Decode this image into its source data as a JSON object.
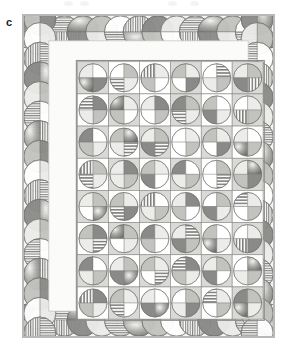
{
  "figure": {
    "panel_label": "c",
    "type": "quilt-diagram"
  },
  "colors": {
    "page_background": "#ffffff",
    "frame_background": "#f4f4f2",
    "frame_border": "#b9b9b6",
    "sashing_border": "#8d8d8a",
    "cell_light": "#ffffff",
    "cell_mid": "#d9d9d6",
    "cell_dark": "#b2b2af",
    "fill_solid_dark": "#8a8a88",
    "fill_solid_mid": "#c2c2bf",
    "fill_solid_light": "#ececea",
    "fill_white": "#ffffff",
    "stripe_ink": "#7d7d7b",
    "outline": "#6f6f6d",
    "label_text": "#1a1a1a"
  },
  "layout": {
    "frame": {
      "x": 22,
      "y": 14,
      "width": 253,
      "height": 324
    },
    "border_band": {
      "thickness": 26,
      "motif": "interlaced-circles"
    },
    "inner_margin": {
      "thickness": 12,
      "fill": "#fbfbfa"
    },
    "grid": {
      "x": 55,
      "y": 47,
      "width": 187,
      "height": 259,
      "columns": 6,
      "rows": 8,
      "cell_width": 31.2,
      "cell_height": 32.4,
      "block_motif": "quartered-circle"
    }
  },
  "legend_fills": [
    {
      "key": "solid-dark",
      "label": "solid dark gray"
    },
    {
      "key": "solid-mid",
      "label": "solid medium gray"
    },
    {
      "key": "solid-light",
      "label": "solid light gray"
    },
    {
      "key": "white",
      "label": "white"
    },
    {
      "key": "hstripe",
      "label": "horizontal stripe"
    },
    {
      "key": "vstripe",
      "label": "vertical stripe"
    },
    {
      "key": "grad",
      "label": "shaded gradient"
    }
  ],
  "chart_data": {
    "type": "heatmap",
    "title": "",
    "xlabel": "",
    "ylabel": "",
    "columns": 6,
    "rows": 8,
    "categories": [
      "1",
      "2",
      "3",
      "4",
      "5",
      "6"
    ],
    "row_labels": [
      "1",
      "2",
      "3",
      "4",
      "5",
      "6",
      "7",
      "8"
    ],
    "cell_encoding": "each grid cell is a circle split into 4 quadrants (TL, TR, BR, BL); value names the fill of each quadrant",
    "grid": [
      [
        {
          "bg": "mid",
          "q": [
            "solid-light",
            "white",
            "solid-dark",
            "grad"
          ]
        },
        {
          "bg": "light",
          "q": [
            "white",
            "solid-mid",
            "solid-light",
            "hstripe"
          ]
        },
        {
          "bg": "light",
          "q": [
            "vstripe",
            "solid-light",
            "white",
            "solid-mid"
          ]
        },
        {
          "bg": "mid",
          "q": [
            "solid-mid",
            "solid-light",
            "solid-dark",
            "white"
          ]
        },
        {
          "bg": "light",
          "q": [
            "white",
            "hstripe",
            "solid-mid",
            "solid-light"
          ]
        },
        {
          "bg": "mid",
          "q": [
            "solid-light",
            "solid-mid",
            "vstripe",
            "solid-dark"
          ]
        }
      ],
      [
        {
          "bg": "light",
          "q": [
            "hstripe",
            "solid-dark",
            "solid-mid",
            "solid-light"
          ]
        },
        {
          "bg": "mid",
          "q": [
            "grad",
            "solid-light",
            "white",
            "solid-mid"
          ]
        },
        {
          "bg": "light",
          "q": [
            "solid-light",
            "solid-dark",
            "solid-mid",
            "white"
          ]
        },
        {
          "bg": "mid",
          "q": [
            "solid-dark",
            "solid-mid",
            "solid-light",
            "hstripe"
          ]
        },
        {
          "bg": "light",
          "q": [
            "solid-mid",
            "white",
            "solid-light",
            "solid-dark"
          ]
        },
        {
          "bg": "mid",
          "q": [
            "white",
            "solid-light",
            "solid-mid",
            "vstripe"
          ]
        }
      ],
      [
        {
          "bg": "mid",
          "q": [
            "solid-dark",
            "white",
            "solid-light",
            "solid-mid"
          ]
        },
        {
          "bg": "light",
          "q": [
            "solid-mid",
            "grad",
            "hstripe",
            "solid-light"
          ]
        },
        {
          "bg": "mid",
          "q": [
            "solid-light",
            "solid-mid",
            "hstripe",
            "solid-dark"
          ]
        },
        {
          "bg": "light",
          "q": [
            "white",
            "solid-light",
            "solid-mid",
            "white"
          ]
        },
        {
          "bg": "mid",
          "q": [
            "solid-mid",
            "solid-light",
            "solid-dark",
            "white"
          ]
        },
        {
          "bg": "light",
          "q": [
            "solid-light",
            "white",
            "solid-mid",
            "grad"
          ]
        }
      ],
      [
        {
          "bg": "light",
          "q": [
            "vstripe",
            "solid-mid",
            "solid-light",
            "hstripe"
          ]
        },
        {
          "bg": "mid",
          "q": [
            "solid-light",
            "solid-dark",
            "solid-mid",
            "solid-light"
          ]
        },
        {
          "bg": "light",
          "q": [
            "solid-mid",
            "solid-light",
            "white",
            "solid-dark"
          ]
        },
        {
          "bg": "mid",
          "q": [
            "solid-dark",
            "white",
            "solid-mid",
            "solid-light"
          ]
        },
        {
          "bg": "light",
          "q": [
            "white",
            "solid-mid",
            "hstripe",
            "white"
          ]
        },
        {
          "bg": "mid",
          "q": [
            "solid-light",
            "grad",
            "solid-dark",
            "solid-mid"
          ]
        }
      ],
      [
        {
          "bg": "mid",
          "q": [
            "solid-light",
            "solid-mid",
            "grad",
            "white"
          ]
        },
        {
          "bg": "light",
          "q": [
            "solid-mid",
            "solid-light",
            "solid-dark",
            "hstripe"
          ]
        },
        {
          "bg": "mid",
          "q": [
            "vstripe",
            "white",
            "solid-mid",
            "solid-light"
          ]
        },
        {
          "bg": "light",
          "q": [
            "solid-light",
            "solid-dark",
            "white",
            "solid-mid"
          ]
        },
        {
          "bg": "mid",
          "q": [
            "white",
            "solid-mid",
            "solid-light",
            "solid-dark"
          ]
        },
        {
          "bg": "light",
          "q": [
            "hstripe",
            "solid-light",
            "solid-mid",
            "white"
          ]
        }
      ],
      [
        {
          "bg": "light",
          "q": [
            "solid-mid",
            "solid-dark",
            "hstripe",
            "solid-light"
          ]
        },
        {
          "bg": "mid",
          "q": [
            "grad",
            "solid-mid",
            "solid-light",
            "white"
          ]
        },
        {
          "bg": "light",
          "q": [
            "solid-dark",
            "solid-light",
            "white",
            "solid-mid"
          ]
        },
        {
          "bg": "mid",
          "q": [
            "solid-light",
            "hstripe",
            "solid-mid",
            "solid-dark"
          ]
        },
        {
          "bg": "light",
          "q": [
            "solid-mid",
            "white",
            "solid-light",
            "grad"
          ]
        },
        {
          "bg": "mid",
          "q": [
            "white",
            "solid-light",
            "solid-dark",
            "vstripe"
          ]
        }
      ],
      [
        {
          "bg": "mid",
          "q": [
            "solid-dark",
            "white",
            "solid-mid",
            "solid-light"
          ]
        },
        {
          "bg": "light",
          "q": [
            "solid-light",
            "solid-mid",
            "grad",
            "solid-dark"
          ]
        },
        {
          "bg": "mid",
          "q": [
            "solid-mid",
            "solid-light",
            "hstripe",
            "white"
          ]
        },
        {
          "bg": "light",
          "q": [
            "hstripe",
            "solid-dark",
            "solid-light",
            "solid-mid"
          ]
        },
        {
          "bg": "mid",
          "q": [
            "solid-light",
            "solid-mid",
            "white",
            "solid-dark"
          ]
        },
        {
          "bg": "light",
          "q": [
            "white",
            "grad",
            "solid-mid",
            "solid-light"
          ]
        }
      ],
      [
        {
          "bg": "light",
          "q": [
            "vstripe",
            "solid-dark",
            "solid-light",
            "solid-mid"
          ]
        },
        {
          "bg": "mid",
          "q": [
            "solid-mid",
            "solid-light",
            "white",
            "hstripe"
          ]
        },
        {
          "bg": "light",
          "q": [
            "solid-light",
            "white",
            "grad",
            "solid-dark"
          ]
        },
        {
          "bg": "mid",
          "q": [
            "white",
            "solid-mid",
            "solid-dark",
            "solid-light"
          ]
        },
        {
          "bg": "light",
          "q": [
            "hstripe",
            "solid-light",
            "solid-mid",
            "white"
          ]
        },
        {
          "bg": "mid",
          "q": [
            "solid-dark",
            "solid-mid",
            "solid-light",
            "grad"
          ]
        }
      ]
    ],
    "border_motif": {
      "type": "interlaced-circle-chain",
      "top_count": 13,
      "bottom_count": 13,
      "left_count": 16,
      "right_count": 16,
      "fills": [
        "solid-dark",
        "solid-mid",
        "solid-light",
        "white",
        "hstripe",
        "vstripe",
        "grad"
      ]
    }
  }
}
